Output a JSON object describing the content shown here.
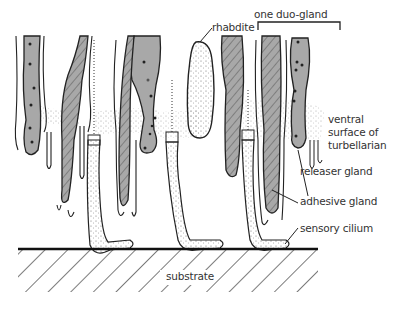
{
  "diagram": {
    "labels": {
      "rhabdite": "rhabdite",
      "duo_gland": "one duo-gland",
      "ventral_surface_line1": "ventral",
      "ventral_surface_line2": "surface of",
      "ventral_surface_line3": "turbellarian",
      "releaser_gland": "releaser gland",
      "adhesive_gland": "adhesive gland",
      "sensory_cilium": "sensory cilium",
      "substrate": "substrate"
    },
    "colors": {
      "gland_fill": "#a8a8a8",
      "outline": "#222222",
      "background": "#ffffff",
      "text": "#333333"
    }
  }
}
